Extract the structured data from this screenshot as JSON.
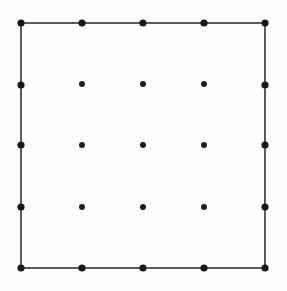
{
  "figure": {
    "width": 287,
    "height": 291,
    "background_color": "#fdfdfc"
  },
  "chart_data": {
    "type": "scatter",
    "xlabel": "",
    "ylabel": "",
    "grid": false,
    "legend": null,
    "axis_visible": false,
    "rows": 5,
    "columns": 5,
    "total_points": 25,
    "boundary_points": 16,
    "interior_points": 9,
    "xlim": [
      0,
      287
    ],
    "ylim": [
      0,
      291
    ],
    "x_tick_positions": [
      21,
      82,
      143,
      204,
      265
    ],
    "y_tick_positions": [
      23,
      85,
      145,
      207,
      268
    ],
    "marker_color": "#1d1d1d",
    "boundary_marker_radius": 3.6,
    "interior_marker_radius": 3.0,
    "edge_color": "#242424",
    "edge_width": 1.5,
    "points": [
      {
        "id": "p-0-0",
        "row": 0,
        "col": 0,
        "x": 21,
        "y": 23,
        "kind": "boundary",
        "corner": "top-left"
      },
      {
        "id": "p-0-1",
        "row": 0,
        "col": 1,
        "x": 82,
        "y": 23,
        "kind": "boundary",
        "corner": null
      },
      {
        "id": "p-0-2",
        "row": 0,
        "col": 2,
        "x": 143,
        "y": 23,
        "kind": "boundary",
        "corner": null
      },
      {
        "id": "p-0-3",
        "row": 0,
        "col": 3,
        "x": 204,
        "y": 23,
        "kind": "boundary",
        "corner": null
      },
      {
        "id": "p-0-4",
        "row": 0,
        "col": 4,
        "x": 265,
        "y": 23,
        "kind": "boundary",
        "corner": "top-right"
      },
      {
        "id": "p-1-0",
        "row": 1,
        "col": 0,
        "x": 21,
        "y": 85,
        "kind": "boundary",
        "corner": null
      },
      {
        "id": "p-1-1",
        "row": 1,
        "col": 1,
        "x": 82,
        "y": 84,
        "kind": "interior",
        "corner": null
      },
      {
        "id": "p-1-2",
        "row": 1,
        "col": 2,
        "x": 143,
        "y": 84,
        "kind": "interior",
        "corner": null
      },
      {
        "id": "p-1-3",
        "row": 1,
        "col": 3,
        "x": 204,
        "y": 84,
        "kind": "interior",
        "corner": null
      },
      {
        "id": "p-1-4",
        "row": 1,
        "col": 4,
        "x": 265,
        "y": 85,
        "kind": "boundary",
        "corner": null
      },
      {
        "id": "p-2-0",
        "row": 2,
        "col": 0,
        "x": 21,
        "y": 145,
        "kind": "boundary",
        "corner": null
      },
      {
        "id": "p-2-1",
        "row": 2,
        "col": 1,
        "x": 82,
        "y": 145,
        "kind": "interior",
        "corner": null
      },
      {
        "id": "p-2-2",
        "row": 2,
        "col": 2,
        "x": 143,
        "y": 145,
        "kind": "interior",
        "corner": null
      },
      {
        "id": "p-2-3",
        "row": 2,
        "col": 3,
        "x": 204,
        "y": 145,
        "kind": "interior",
        "corner": null
      },
      {
        "id": "p-2-4",
        "row": 2,
        "col": 4,
        "x": 265,
        "y": 145,
        "kind": "boundary",
        "corner": null
      },
      {
        "id": "p-3-0",
        "row": 3,
        "col": 0,
        "x": 21,
        "y": 207,
        "kind": "boundary",
        "corner": null
      },
      {
        "id": "p-3-1",
        "row": 3,
        "col": 1,
        "x": 82,
        "y": 207,
        "kind": "interior",
        "corner": null
      },
      {
        "id": "p-3-2",
        "row": 3,
        "col": 2,
        "x": 143,
        "y": 207,
        "kind": "interior",
        "corner": null
      },
      {
        "id": "p-3-3",
        "row": 3,
        "col": 3,
        "x": 204,
        "y": 207,
        "kind": "interior",
        "corner": null
      },
      {
        "id": "p-3-4",
        "row": 3,
        "col": 4,
        "x": 265,
        "y": 207,
        "kind": "boundary",
        "corner": null
      },
      {
        "id": "p-4-0",
        "row": 4,
        "col": 0,
        "x": 21,
        "y": 268,
        "kind": "boundary",
        "corner": "bottom-left"
      },
      {
        "id": "p-4-1",
        "row": 4,
        "col": 1,
        "x": 82,
        "y": 268,
        "kind": "boundary",
        "corner": null
      },
      {
        "id": "p-4-2",
        "row": 4,
        "col": 2,
        "x": 143,
        "y": 268,
        "kind": "boundary",
        "corner": null
      },
      {
        "id": "p-4-3",
        "row": 4,
        "col": 3,
        "x": 204,
        "y": 268,
        "kind": "boundary",
        "corner": null
      },
      {
        "id": "p-4-4",
        "row": 4,
        "col": 4,
        "x": 265,
        "y": 268,
        "kind": "boundary",
        "corner": "bottom-right"
      }
    ],
    "edges": [
      {
        "id": "edge-top",
        "name": "top-edge",
        "x1": 21,
        "y1": 23,
        "x2": 265,
        "y2": 23
      },
      {
        "id": "edge-right",
        "name": "right-edge",
        "x1": 265,
        "y1": 23,
        "x2": 265,
        "y2": 268
      },
      {
        "id": "edge-bottom",
        "name": "bottom-edge",
        "x1": 265,
        "y1": 268,
        "x2": 21,
        "y2": 268
      },
      {
        "id": "edge-left",
        "name": "left-edge",
        "x1": 21,
        "y1": 268,
        "x2": 21,
        "y2": 23
      }
    ]
  }
}
